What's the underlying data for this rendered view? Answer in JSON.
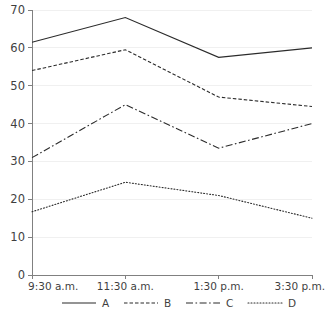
{
  "chart_data": {
    "type": "line",
    "title": "",
    "xlabel": "",
    "ylabel": "",
    "categories": [
      "9:30 a.m.",
      "11:30 a.m.",
      "1:30 p.m.",
      "3:30 p.m."
    ],
    "series": [
      {
        "name": "A",
        "style": "solid",
        "values": [
          61.5,
          68.0,
          57.5,
          60.0
        ]
      },
      {
        "name": "B",
        "style": "dashed",
        "values": [
          54.0,
          59.5,
          47.0,
          44.5
        ]
      },
      {
        "name": "C",
        "style": "dash-dot",
        "values": [
          31.0,
          45.0,
          33.5,
          40.0
        ]
      },
      {
        "name": "D",
        "style": "dotted",
        "values": [
          16.7,
          24.5,
          21.0,
          15.0
        ]
      }
    ],
    "ylim": [
      0,
      70
    ],
    "yticks": [
      0,
      10,
      20,
      30,
      40,
      50,
      60,
      70
    ],
    "ytick_labels": [
      "0",
      "10",
      "20",
      "30",
      "40",
      "50",
      "60",
      "70"
    ],
    "xtick_labels": [
      "9:30 a.m.",
      "11:30 a.m.",
      "1:30 p.m.",
      "3:30 p.m."
    ],
    "grid": true,
    "legend_position": "bottom",
    "line_color": "#2b2b2b",
    "grid_color": "#f0f0f0",
    "axis_color": "#808080"
  },
  "legend": {
    "items": [
      {
        "label": "A"
      },
      {
        "label": "B"
      },
      {
        "label": "C"
      },
      {
        "label": "D"
      }
    ]
  }
}
